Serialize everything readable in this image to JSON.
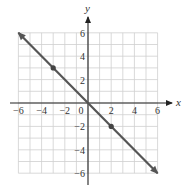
{
  "chart_data": {
    "type": "line",
    "title": "",
    "xlabel": "x",
    "ylabel": "y",
    "xlim": [
      -6,
      6
    ],
    "ylim": [
      -6,
      6
    ],
    "grid": true,
    "grid_step": 1,
    "x_ticks": [
      -6,
      -4,
      -2,
      0,
      2,
      4,
      6
    ],
    "y_ticks": [
      -6,
      -4,
      -2,
      2,
      4,
      6
    ],
    "x_tick_labels": [
      "-6",
      "-4",
      "-2",
      "0",
      "2",
      "4",
      "6"
    ],
    "y_tick_labels": [
      "-6",
      "-4",
      "-2",
      "2",
      "4",
      "6"
    ],
    "series": [
      {
        "name": "y = -x",
        "equation": "y = -x",
        "x": [
          -6,
          6
        ],
        "y": [
          6,
          -6
        ],
        "arrows_both_ends": true,
        "color": "#555555"
      }
    ],
    "points": [
      {
        "x": -3,
        "y": 3,
        "label": ""
      },
      {
        "x": 2,
        "y": -2,
        "label": ""
      }
    ],
    "legend": null
  },
  "colors": {
    "grid": "#cfcfcf",
    "axis": "#222222",
    "line": "#555555",
    "point": "#444444"
  }
}
